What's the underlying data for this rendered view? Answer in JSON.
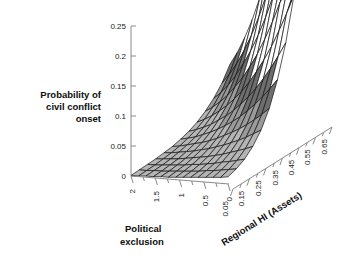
{
  "figure": {
    "kind": "surface-plot",
    "background": "#ffffff"
  },
  "zaxis": {
    "title_lines": [
      "Probability of",
      "civil conflict",
      "onset"
    ],
    "ticks": [
      "0",
      "0.05",
      "0.1",
      "0.15",
      "0.2",
      "0.25"
    ],
    "range": [
      0,
      0.25
    ]
  },
  "xaxis": {
    "title": "Political exclusion",
    "ticks": [
      "2",
      "1.5",
      "1",
      "0.5",
      "0"
    ],
    "range": [
      2,
      0
    ]
  },
  "yaxis": {
    "title": "Regional HI (Assets)",
    "ticks": [
      "0.05",
      "0.15",
      "0.25",
      "0.35",
      "0.45",
      "0.55",
      "0.65"
    ],
    "range": [
      0.05,
      0.65
    ]
  },
  "palette": {
    "band_1": "#b5b5b5",
    "band_2": "#9a9a9a",
    "band_3": "#6e6e6e",
    "band_4": "#ffffff",
    "band_5": "#1c1c1c",
    "mesh": "#141414",
    "axis": "#8a8a8a",
    "text": "#1a1a1a"
  },
  "chart_data": {
    "type": "surface",
    "title": "",
    "xlabel": "Political exclusion",
    "ylabel": "Regional HI (Assets)",
    "zlabel": "Probability of civil conflict onset",
    "xlim": [
      2,
      0
    ],
    "ylim": [
      0.05,
      0.65
    ],
    "zlim": [
      0,
      0.25
    ],
    "grid": false,
    "legend": "none",
    "x": [
      2.0,
      1.846,
      1.692,
      1.538,
      1.385,
      1.231,
      1.077,
      0.923,
      0.769,
      0.615,
      0.462,
      0.308,
      0.154,
      0.0
    ],
    "y": [
      0.05,
      0.1,
      0.15,
      0.2,
      0.25,
      0.3,
      0.35,
      0.4,
      0.45,
      0.5,
      0.55,
      0.6,
      0.65
    ],
    "z_note": "z[yi][xi] = probability of civil conflict onset; rises sharply as Regional HI increases and political exclusion decreases toward 0",
    "z": [
      [
        0.001,
        0.001,
        0.002,
        0.002,
        0.003,
        0.003,
        0.004,
        0.005,
        0.006,
        0.007,
        0.008,
        0.009,
        0.01,
        0.012
      ],
      [
        0.002,
        0.002,
        0.003,
        0.003,
        0.004,
        0.005,
        0.006,
        0.007,
        0.008,
        0.01,
        0.011,
        0.013,
        0.015,
        0.017
      ],
      [
        0.003,
        0.003,
        0.004,
        0.005,
        0.006,
        0.007,
        0.009,
        0.01,
        0.012,
        0.014,
        0.017,
        0.019,
        0.022,
        0.025
      ],
      [
        0.004,
        0.005,
        0.006,
        0.007,
        0.009,
        0.011,
        0.013,
        0.015,
        0.018,
        0.021,
        0.025,
        0.029,
        0.033,
        0.038
      ],
      [
        0.006,
        0.007,
        0.009,
        0.011,
        0.013,
        0.016,
        0.019,
        0.023,
        0.027,
        0.032,
        0.037,
        0.043,
        0.05,
        0.057
      ],
      [
        0.008,
        0.01,
        0.013,
        0.016,
        0.019,
        0.023,
        0.028,
        0.034,
        0.04,
        0.047,
        0.055,
        0.064,
        0.074,
        0.085
      ],
      [
        0.012,
        0.015,
        0.018,
        0.023,
        0.028,
        0.034,
        0.041,
        0.049,
        0.058,
        0.069,
        0.081,
        0.094,
        0.109,
        0.125
      ],
      [
        0.017,
        0.021,
        0.026,
        0.032,
        0.04,
        0.048,
        0.058,
        0.07,
        0.083,
        0.098,
        0.115,
        0.134,
        0.155,
        0.178
      ],
      [
        0.024,
        0.03,
        0.037,
        0.046,
        0.056,
        0.068,
        0.082,
        0.098,
        0.117,
        0.138,
        0.161,
        0.188,
        0.217,
        0.249
      ],
      [
        0.034,
        0.042,
        0.052,
        0.064,
        0.079,
        0.095,
        0.115,
        0.137,
        0.163,
        0.192,
        0.225,
        0.261,
        0.302,
        0.347
      ],
      [
        0.047,
        0.058,
        0.072,
        0.089,
        0.109,
        0.132,
        0.159,
        0.19,
        0.226,
        0.266,
        0.311,
        0.362,
        0.418,
        0.48
      ],
      [
        0.064,
        0.08,
        0.099,
        0.122,
        0.149,
        0.181,
        0.218,
        0.26,
        0.309,
        0.364,
        0.426,
        0.495,
        0.572,
        0.657
      ],
      [
        0.088,
        0.109,
        0.135,
        0.166,
        0.203,
        0.246,
        0.296,
        0.354,
        0.42,
        0.495,
        0.579,
        0.673,
        0.778,
        0.893
      ]
    ],
    "z_display_max": 0.25
  }
}
